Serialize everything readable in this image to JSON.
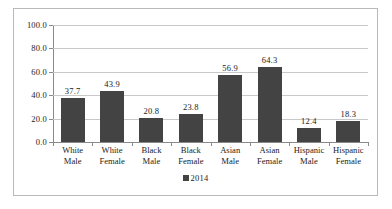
{
  "chart_data": {
    "type": "bar",
    "title": "",
    "subtitle": "",
    "xlabel": "",
    "ylabel": "",
    "categories": [
      "White Male",
      "White Female",
      "Black Male",
      "Black Female",
      "Asian Male",
      "Asian Female",
      "Hispanic Male",
      "Hispanic Female"
    ],
    "category_lines": [
      [
        "White",
        "Male"
      ],
      [
        "White",
        "Female"
      ],
      [
        "Black",
        "Male"
      ],
      [
        "Black",
        "Female"
      ],
      [
        "Asian",
        "Male"
      ],
      [
        "Asian",
        "Female"
      ],
      [
        "Hispanic",
        "Male"
      ],
      [
        "Hispanic",
        "Female"
      ]
    ],
    "series": [
      {
        "name": "2014",
        "color": "#434343",
        "values": [
          37.7,
          43.9,
          20.8,
          23.8,
          56.9,
          64.3,
          12.4,
          18.3
        ]
      }
    ],
    "data_labels": [
      "37.7",
      "43.9",
      "20.8",
      "23.8",
      "56.9",
      "64.3",
      "12.4",
      "18.3"
    ],
    "ylim": [
      0,
      100
    ],
    "ytick_values": [
      100,
      80,
      60,
      40,
      20,
      0
    ],
    "ytick_labels": [
      "100.0",
      "80.0",
      "60.0",
      "40.0",
      "20.0",
      "0.0"
    ],
    "grid": true,
    "grid_axis": "y",
    "legend": {
      "position": "bottom-center",
      "entries": [
        {
          "label": "2014",
          "color": "#434343",
          "marker": "square"
        }
      ]
    },
    "colors": {
      "bar": "#434343",
      "gridline": "#c8c8c8",
      "axis": "#8a8a8a",
      "frame_border": "#b9b9b9",
      "text": "#1c1c1c",
      "background": "#ffffff"
    }
  }
}
